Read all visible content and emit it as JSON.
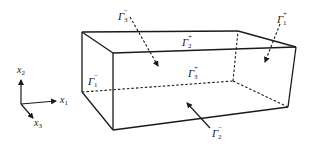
{
  "figure": {
    "axes": {
      "x1": {
        "symbol": "x",
        "index": "1"
      },
      "x2": {
        "symbol": "x",
        "index": "2"
      },
      "x3": {
        "symbol": "x",
        "index": "3"
      }
    },
    "faces": [
      {
        "id": "gamma-3-minus",
        "symbol": "Γ",
        "sub": "3",
        "sup": "−",
        "position": "top-back",
        "arrow": "dashed, pointing into the box"
      },
      {
        "id": "gamma-2-plus",
        "symbol": "Γ",
        "sub": "2",
        "sup": "+",
        "position": "top face"
      },
      {
        "id": "gamma-1-plus",
        "symbol": "Γ",
        "sub": "1",
        "sup": "+",
        "position": "right face",
        "arrow": "dashed, pointing into the box"
      },
      {
        "id": "gamma-1-minus",
        "symbol": "Γ",
        "sub": "1",
        "sup": "−",
        "position": "left face"
      },
      {
        "id": "gamma-3-plus",
        "symbol": "Γ",
        "sub": "3",
        "sup": "+",
        "position": "front face"
      },
      {
        "id": "gamma-2-minus",
        "symbol": "Γ",
        "sub": "2",
        "sup": "−",
        "position": "bottom face",
        "arrow": "pointing up into the box"
      }
    ]
  }
}
